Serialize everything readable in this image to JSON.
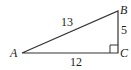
{
  "diagram": {
    "type": "right-triangle",
    "vertices": [
      {
        "name": "A",
        "x": 22,
        "y": 53
      },
      {
        "name": "B",
        "x": 118,
        "y": 11
      },
      {
        "name": "C",
        "x": 118,
        "y": 53
      }
    ],
    "vertex_labels": {
      "A": "A",
      "B": "B",
      "C": "C"
    },
    "side_labels": {
      "AB": "13",
      "BC": "5",
      "AC": "12"
    },
    "right_angle_at": "C",
    "stroke_color": "#333333"
  }
}
